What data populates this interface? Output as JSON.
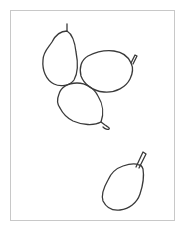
{
  "image": {
    "description": "Line drawing of four pears on white background inside a thin gray frame",
    "frame_color": "#c8c8c8",
    "stroke_color": "#3a3a3a",
    "background_color": "#ffffff"
  },
  "pears": [
    {
      "name": "pear-top-left",
      "orientation": "upright, stem at top"
    },
    {
      "name": "pear-top-right",
      "orientation": "tilted, stem at upper right"
    },
    {
      "name": "pear-middle",
      "orientation": "tilted, stem at lower right"
    },
    {
      "name": "pear-bottom-right",
      "orientation": "tilted, stem at upper right"
    }
  ]
}
